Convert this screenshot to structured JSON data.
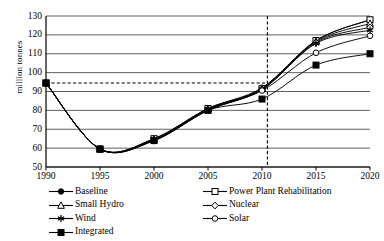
{
  "chart_data": {
    "type": "line",
    "title": "",
    "xlabel": "",
    "ylabel": "million tonnes",
    "xlim": [
      1990,
      2020
    ],
    "ylim": [
      50,
      130
    ],
    "ytick_step": 10,
    "grid": true,
    "legend_position": "bottom",
    "x": [
      1990,
      1995,
      2000,
      2005,
      2010,
      2015,
      2020
    ],
    "xticklabels": [
      "1990",
      "1995",
      "2000",
      "2005",
      "2010",
      "2015",
      "2020"
    ],
    "yticklabels": [
      "50",
      "60",
      "70",
      "80",
      "90",
      "100",
      "110",
      "120",
      "130"
    ],
    "annotations": {
      "reference_hline_value": 94.5,
      "reference_vline_x": 2010.5
    },
    "series": [
      {
        "name": "Baseline",
        "marker": "filled-circle",
        "values": [
          94.5,
          59.5,
          65.0,
          81.0,
          92.0,
          117.0,
          128.0
        ]
      },
      {
        "name": "Power Plant Rehabilitation",
        "marker": "open-square",
        "values": [
          94.5,
          59.5,
          65.0,
          81.0,
          91.5,
          117.0,
          128.0
        ]
      },
      {
        "name": "Small Hydro",
        "marker": "open-triangle",
        "values": [
          94.5,
          59.5,
          64.5,
          80.5,
          91.5,
          116.5,
          126.0
        ]
      },
      {
        "name": "Nuclear",
        "marker": "open-diamond",
        "values": [
          94.5,
          59.5,
          64.5,
          80.5,
          91.0,
          116.0,
          124.0
        ]
      },
      {
        "name": "Wind",
        "marker": "asterisk",
        "values": [
          94.5,
          59.5,
          64.0,
          80.0,
          91.0,
          115.5,
          122.5
        ]
      },
      {
        "name": "Solar",
        "marker": "open-circle",
        "values": [
          94.5,
          59.5,
          64.0,
          80.0,
          90.5,
          110.5,
          119.5
        ]
      },
      {
        "name": "Integrated",
        "marker": "filled-square",
        "values": [
          94.5,
          59.5,
          64.0,
          80.0,
          86.0,
          104.0,
          110.0
        ]
      }
    ]
  },
  "axis": {
    "ylabel": "million tonnes",
    "yticks": [
      "130",
      "120",
      "110",
      "100",
      "90",
      "80",
      "70",
      "60",
      "50"
    ],
    "xticks": [
      "1990",
      "1995",
      "2000",
      "2005",
      "2010",
      "2015",
      "2020"
    ]
  },
  "legend": {
    "left": [
      {
        "label": "Baseline",
        "marker": "filled-circle"
      },
      {
        "label": "Small Hydro",
        "marker": "open-triangle"
      },
      {
        "label": "Wind",
        "marker": "asterisk"
      },
      {
        "label": "Integrated",
        "marker": "filled-square"
      }
    ],
    "right": [
      {
        "label": "Power Plant Rehabilitation",
        "marker": "open-square"
      },
      {
        "label": "Nuclear",
        "marker": "open-diamond"
      },
      {
        "label": "Solar",
        "marker": "open-circle"
      }
    ]
  },
  "colors": {
    "line": "#000000",
    "grid": "#4d4d4d",
    "axis": "#000000",
    "background": "#ffffff"
  }
}
